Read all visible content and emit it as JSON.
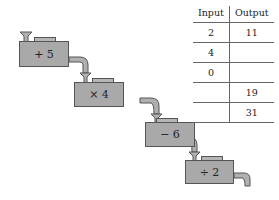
{
  "machines": [
    {
      "label": "+ 5"
    },
    {
      "label": "× 4"
    },
    {
      "label": "− 6"
    },
    {
      "label": "÷ 2"
    }
  ],
  "table": {
    "headers": [
      "Input",
      "Output"
    ],
    "rows": [
      {
        "input": "2",
        "output": "11"
      },
      {
        "input": "4",
        "output": ""
      },
      {
        "input": "0",
        "output": ""
      },
      {
        "input": "",
        "output": "19"
      },
      {
        "input": "",
        "output": "31"
      }
    ]
  },
  "colors": {
    "box": "#a9a9a9",
    "outline": "#555555"
  }
}
